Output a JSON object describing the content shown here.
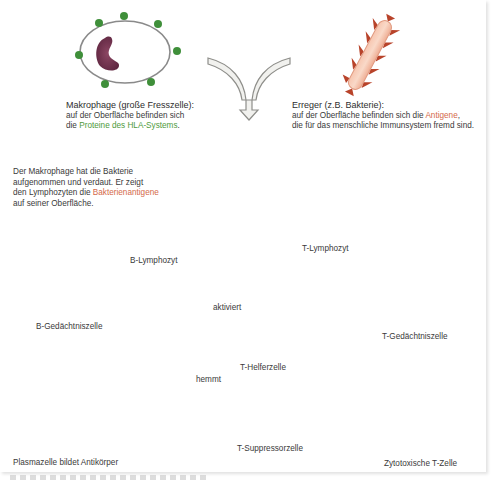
{
  "diagram": {
    "macrophage": {
      "title": "Makrophage (große Fresszelle):",
      "line1": "auf der Oberfläche befinden sich",
      "line2_pre": "die ",
      "line2_highlight": "Proteine des HLA-Systems",
      "line2_post": "."
    },
    "pathogen": {
      "title": "Erreger (z.B. Bakterie):",
      "line1_pre": "auf der Oberfläche befinden sich die ",
      "line1_highlight": "Antigene",
      "line1_post": ",",
      "line2": "die für das menschliche Immunsystem fremd sind."
    },
    "presentation": {
      "line1": "Der Makrophage hat die Bakterie",
      "line2": "aufgenommen und verdaut. Er zeigt",
      "line3_pre": "den Lymphozyten die ",
      "line3_highlight": "Bakterienantigene",
      "line4": "auf seiner Oberfläche."
    },
    "cells": {
      "b_lymphocyte": "B-Lymphozyt",
      "t_lymphocyte": "T-Lymphozyt",
      "b_memory": "B-Gedächtniszelle",
      "t_memory": "T-Gedächtniszelle",
      "t_helper": "T-Helferzelle",
      "t_suppressor": "T-Suppressorzelle",
      "cytotoxic_t": "Zytotoxische T-Zelle",
      "plasma": "Plasmazelle bildet Antikörper"
    },
    "effects": {
      "activates": "aktiviert",
      "activates_symbol": "+",
      "inhibits": "hemmt",
      "inhibits_symbol": "−"
    },
    "colors": {
      "hla_green": "#3f8f3a",
      "antigen_red": "#b8432a",
      "nucleus": "#7a3550",
      "receptor": "#dbeaa6",
      "arrow_fill": "#f1f1ee",
      "arrow_stroke": "#8e8e8a",
      "plus_fill": "#c9e59a",
      "minus_fill": "#f3b49a",
      "plasma_fill": "#f6c98c"
    }
  }
}
